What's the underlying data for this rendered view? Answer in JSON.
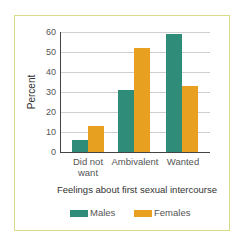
{
  "chart_data": {
    "type": "bar",
    "title": "",
    "xlabel": "Feelings about first sexual intercourse",
    "ylabel": "Percent",
    "ylim": [
      0,
      60
    ],
    "yticks": [
      0,
      10,
      20,
      30,
      40,
      50,
      60
    ],
    "grid": true,
    "legend_position": "bottom",
    "categories": [
      "Did not want",
      "Ambivalent",
      "Wanted"
    ],
    "series": [
      {
        "name": "Males",
        "color": "#2f8c79",
        "values": [
          6,
          31,
          59
        ]
      },
      {
        "name": "Females",
        "color": "#e8a021",
        "values": [
          13,
          52,
          33
        ]
      }
    ]
  },
  "labels": {
    "ylabel": "Percent",
    "xlabel": "Feelings about first sexual intercourse",
    "cat0_line1": "Did not",
    "cat0_line2": "want",
    "cat1": "Ambivalent",
    "cat2": "Wanted",
    "legend_males": "Males",
    "legend_females": "Females",
    "ticks": [
      "0",
      "10",
      "20",
      "30",
      "40",
      "50",
      "60"
    ]
  },
  "colors": {
    "males": "#2f8c79",
    "females": "#e8a021",
    "frame": "#d8dc8a"
  }
}
